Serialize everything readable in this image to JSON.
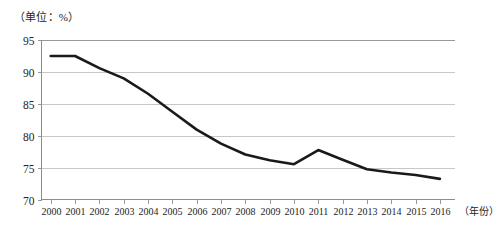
{
  "figure": {
    "unit_label": "（单位：%）",
    "x_axis_title": "（年份）",
    "line_color": "#1a1a1a",
    "grid_color": "#b9b9b9",
    "axis_color": "#8d8d8d",
    "background": "#ffffff"
  },
  "chart_data": {
    "type": "line",
    "title": "",
    "subtitle": "",
    "xlabel": "（年份）",
    "ylabel": "（单位：%）",
    "categories": [
      "2000",
      "2001",
      "2002",
      "2003",
      "2004",
      "2005",
      "2006",
      "2007",
      "2008",
      "2009",
      "2010",
      "2011",
      "2012",
      "2013",
      "2014",
      "2015",
      "2016"
    ],
    "values": [
      92.5,
      92.5,
      90.6,
      89.0,
      86.6,
      83.8,
      81.0,
      78.8,
      77.1,
      76.2,
      75.6,
      77.8,
      76.3,
      74.8,
      74.3,
      73.9,
      73.3
    ],
    "ylim": [
      70,
      95
    ],
    "yticks": [
      70,
      75,
      80,
      85,
      90,
      95
    ],
    "ytick_labels": [
      "70",
      "75",
      "80",
      "85",
      "90",
      "95"
    ],
    "xtick_labels": [
      "2000",
      "2001",
      "2002",
      "2003",
      "2004",
      "2005",
      "2006",
      "2007",
      "2008",
      "2009",
      "2010",
      "2011",
      "2012",
      "2013",
      "2014",
      "2015",
      "2016"
    ],
    "grid": true,
    "grid_axis": "y",
    "legend": false,
    "legend_position": "none",
    "series": [
      {
        "name": "",
        "values": [
          92.5,
          92.5,
          90.6,
          89.0,
          86.6,
          83.8,
          81.0,
          78.8,
          77.1,
          76.2,
          75.6,
          77.8,
          76.3,
          74.8,
          74.3,
          73.9,
          73.3
        ]
      }
    ]
  }
}
